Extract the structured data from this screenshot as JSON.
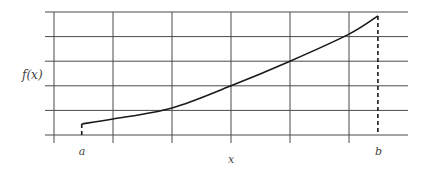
{
  "chart_data": {
    "type": "line",
    "title": "",
    "xlabel": "x",
    "ylabel": "f(x)",
    "grid": true,
    "xlim": [
      0,
      6
    ],
    "ylim": [
      0,
      5
    ],
    "x_gridlines": 6,
    "y_gridlines": 5,
    "interval": {
      "a": 0.47,
      "b": 5.49,
      "a_label": "a",
      "b_label": "b"
    },
    "series": [
      {
        "name": "f(x)",
        "x": [
          0.47,
          1.0,
          2.0,
          3.0,
          4.0,
          5.0,
          5.49
        ],
        "y": [
          0.45,
          0.65,
          1.1,
          2.0,
          3.0,
          4.1,
          4.84
        ]
      }
    ],
    "annotations": [
      {
        "text": "a",
        "x": 0.47,
        "position": "below-axis"
      },
      {
        "text": "b",
        "x": 5.49,
        "position": "below-axis"
      },
      {
        "text": "dashed vertical at a from 0 to f(a)"
      },
      {
        "text": "dashed vertical at b from 0 to f(b)"
      }
    ]
  },
  "labels": {
    "ylabel": "f(x)",
    "xlabel": "x",
    "a": "a",
    "b": "b"
  },
  "colors": {
    "grid": "#4a4a4a",
    "curve": "#1a1a1a",
    "text": "#444444"
  }
}
